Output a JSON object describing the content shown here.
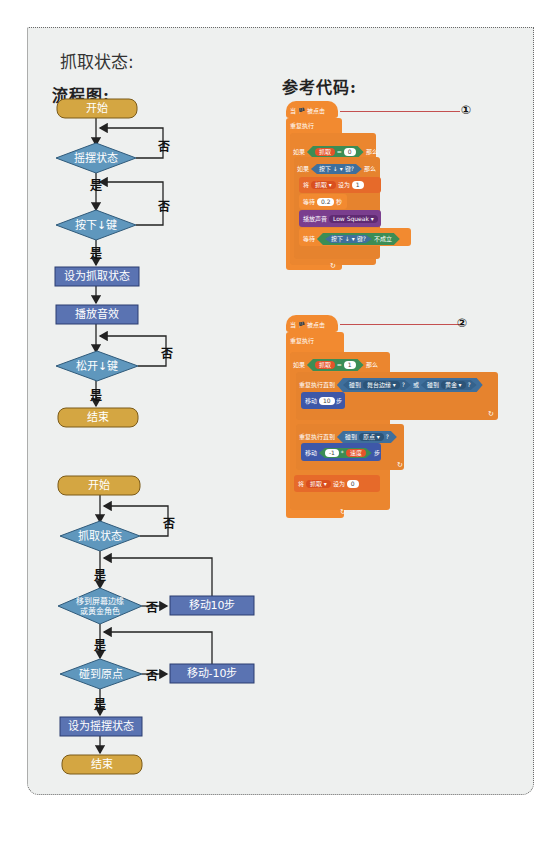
{
  "section_title": "抓取状态:",
  "flowchart_heading": "流程图:",
  "code_heading": "参考代码:",
  "colors": {
    "terminal": "#d4a642",
    "decision": "#5f97bd",
    "process": "#5a73b2",
    "scratch_orange": "#f28a30",
    "scratch_green": "#3c8d55",
    "scratch_blue": "#3f6f9c",
    "scratch_red": "#e5532a",
    "scratch_purple": "#7a3e8e",
    "scratch_darkblue": "#3e58a8"
  },
  "flowchart1": {
    "start": "开始",
    "d1": "摇摆状态",
    "d2": "按下↓键",
    "p1": "设为抓取状态",
    "p2": "播放音效",
    "d3": "松开↓键",
    "end": "结束",
    "yes": "是",
    "no": "否"
  },
  "flowchart2": {
    "start": "开始",
    "d1": "抓取状态",
    "d2_line1": "移到屏幕边缘",
    "d2_line2": "或黄金角色",
    "p_move10": "移动10步",
    "d3": "碰到原点",
    "p_move_neg10": "移动-10步",
    "p_set": "设为摇摆状态",
    "end": "结束",
    "yes": "是",
    "no": "否"
  },
  "code1": {
    "marker": "①",
    "hat": "当 🏴 被点击",
    "forever": "重复执行",
    "if1": "如果",
    "then": "那么",
    "var_grab": "抓取",
    "eq_val0": "0",
    "key_pressed": "按下",
    "key": "↓ ▾",
    "key_q": "键?",
    "set": "将",
    "set_var": "抓取 ▾",
    "set_to": "设为",
    "set_val": "1",
    "wait": "等待",
    "wait_val": "0.2",
    "wait_unit": "秒",
    "play_sound": "播放声音",
    "sound_name": "Low Squeak ▾",
    "wait_until": "等待",
    "not_true": "不成立"
  },
  "code2": {
    "marker": "②",
    "hat": "当 🏴 被点击",
    "forever": "重复执行",
    "if1": "如果",
    "then": "那么",
    "var_grab": "抓取",
    "eq_val1": "1",
    "repeat_until": "重复执行直到",
    "touching": "碰到",
    "edge": "舞台边缘 ▾",
    "q": "?",
    "or": "或",
    "gold": "黄金 ▾",
    "move": "移动",
    "move_val": "10",
    "steps": "步",
    "origin": "原点 ▾",
    "neg1": "-1",
    "speed": "速度",
    "set": "将",
    "set_var": "抓取 ▾",
    "set_to": "设为",
    "set_val": "0"
  }
}
